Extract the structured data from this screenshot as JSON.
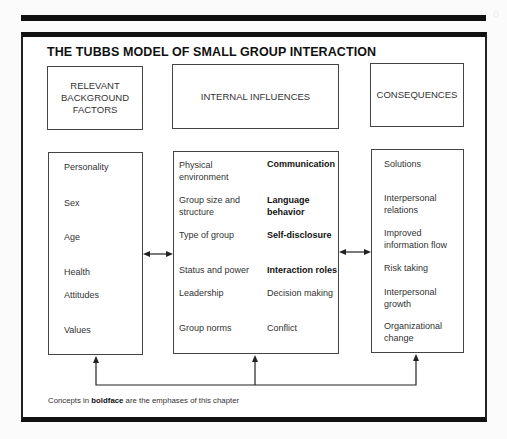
{
  "title": "THE TUBBS MODEL OF SMALL GROUP INTERACTION",
  "headers": {
    "background": "RELEVANT BACKGROUND FACTORS",
    "internal": "INTERNAL INFLUENCES",
    "consequences": "CONSEQUENCES"
  },
  "background_factors": [
    {
      "label": "Personality",
      "bold": false
    },
    {
      "label": "Sex",
      "bold": false
    },
    {
      "label": "Age",
      "bold": false
    },
    {
      "label": "Health",
      "bold": false
    },
    {
      "label": "Attitudes",
      "bold": false
    },
    {
      "label": "Values",
      "bold": false
    }
  ],
  "internal_influences": {
    "left": [
      "Physical environment",
      "Group size and structure",
      "Type of group",
      "Status and power",
      "Leadership",
      "Group norms"
    ],
    "right": [
      {
        "label": "Communication",
        "bold": true
      },
      {
        "label": "Language behavior",
        "bold": true
      },
      {
        "label": "Self-disclosure",
        "bold": true
      },
      {
        "label": "Interaction roles",
        "bold": true
      },
      {
        "label": "Decision making",
        "bold": false
      },
      {
        "label": "Conflict",
        "bold": false
      }
    ]
  },
  "consequences": [
    "Solutions",
    "Interpersonal relations",
    "Improved information flow",
    "Risk taking",
    "Interpersonal growth",
    "Organizational change"
  ],
  "footnote": {
    "prefix": "Concepts in ",
    "bold": "boldface",
    "suffix": " are the emphases of this chapter"
  }
}
